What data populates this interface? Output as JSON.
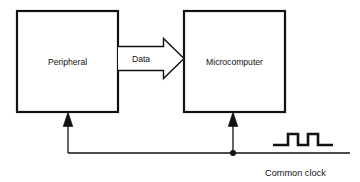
{
  "diagram": {
    "type": "block-diagram",
    "title": "",
    "background_color": "#ffffff",
    "line_color": "#111111",
    "text_color": "#111111",
    "blocks": [
      {
        "id": "peripheral",
        "label": "Peripheral",
        "x": 17,
        "y": 11,
        "width": 101,
        "height": 101,
        "stroke_width": 2.2,
        "fill": "#ffffff"
      },
      {
        "id": "microcomputer",
        "label": "Microcomputer",
        "x": 184,
        "y": 11,
        "width": 101,
        "height": 101,
        "stroke_width": 2.2,
        "fill": "#ffffff"
      }
    ],
    "connections": [
      {
        "id": "data-arrow",
        "label": "Data",
        "from": "peripheral",
        "to": "microcomputer",
        "style": "hollow-block-arrow",
        "direction": "right"
      },
      {
        "id": "clock-bus-peripheral",
        "label": "",
        "from": "common-clock",
        "to": "peripheral",
        "style": "line-with-solid-arrowhead",
        "direction": "up"
      },
      {
        "id": "clock-bus-microcomputer",
        "label": "",
        "from": "common-clock",
        "to": "microcomputer",
        "style": "line-with-solid-arrowhead",
        "direction": "up"
      }
    ],
    "junction": {
      "id": "clock-junction",
      "x": 233,
      "y": 153,
      "radius": 3
    },
    "waveform": {
      "id": "clock-waveform",
      "label": "Common clock",
      "pulses": 2,
      "baseline_y": 152,
      "high_y": 135,
      "start_x": 273,
      "end_x": 333,
      "stroke_width": 2.4
    }
  }
}
